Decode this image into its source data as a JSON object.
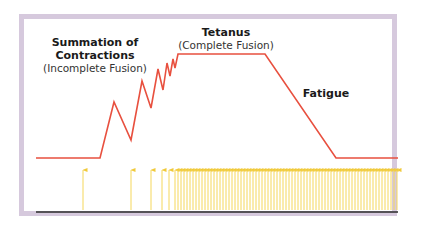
{
  "diagram": {
    "labels": {
      "summation": {
        "title_line1": "Summation of",
        "title_line2": "Contractions",
        "subtitle": "(Incomplete Fusion)"
      },
      "tetanus": {
        "title": "Tetanus",
        "subtitle": "(Complete Fusion)"
      },
      "fatigue": {
        "title": "Fatigue"
      }
    },
    "colors": {
      "frame": "#d6c9dd",
      "tension_line": "#e8503f",
      "stimulus_arrows": "#f5d75a",
      "baseline": "#2a2a2a"
    },
    "tension_curve_points": [
      [
        36,
        158
      ],
      [
        100,
        158
      ],
      [
        114,
        102
      ],
      [
        131,
        140
      ],
      [
        142,
        81
      ],
      [
        151,
        108
      ],
      [
        158,
        69
      ],
      [
        163,
        90
      ],
      [
        167,
        63
      ],
      [
        170,
        76
      ],
      [
        173,
        59
      ],
      [
        175,
        68
      ],
      [
        178,
        54
      ],
      [
        265,
        54
      ],
      [
        336,
        158
      ],
      [
        398,
        158
      ]
    ],
    "stimulus_arrows_x_sparse": [
      83,
      131,
      151,
      162,
      169
    ],
    "stimulus_arrows_dense": {
      "start_x": 175,
      "end_x": 397,
      "spacing": 3
    }
  }
}
